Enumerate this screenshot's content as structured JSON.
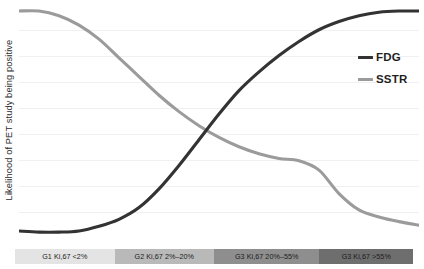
{
  "chart_data": {
    "type": "line",
    "title": "",
    "subtitle": "",
    "xlabel": "",
    "ylabel": "Likelihood of PET study being positive",
    "ylim": [
      0,
      100
    ],
    "xlim": [
      0,
      100
    ],
    "grid": true,
    "grid_orientation": "horizontal",
    "grid_lines": 8,
    "y_tick_labels": [],
    "x_tick_labels": [],
    "legend_position": "right",
    "categories": [
      "G1 Ki,67 <2%",
      "G2 Ki,67 2%–20%",
      "G3 Ki,67 20%–55%",
      "G3 Ki,67 >55%"
    ],
    "category_boundaries_pct": [
      0,
      25,
      50,
      76.5,
      100
    ],
    "category_colors": [
      "#e4e4e4",
      "#b9b9b9",
      "#8e8e8e",
      "#6e6e6e"
    ],
    "series": [
      {
        "name": "FDG",
        "color": "#333333",
        "shape": "rising sigmoid",
        "x": [
          0,
          5,
          10,
          15,
          20,
          25,
          30,
          35,
          40,
          45,
          50,
          55,
          60,
          65,
          70,
          75,
          80,
          85,
          90,
          95,
          100
        ],
        "values": [
          3,
          2.5,
          2.5,
          3,
          5,
          8,
          13,
          21,
          31,
          42,
          53,
          63,
          71,
          78,
          84,
          89,
          92.5,
          95,
          96.5,
          97,
          97
        ]
      },
      {
        "name": "SSTR",
        "color": "#9b9b9b",
        "shape": "falling double sigmoid",
        "x": [
          0,
          5,
          10,
          15,
          20,
          25,
          30,
          35,
          40,
          45,
          50,
          55,
          60,
          65,
          70,
          75,
          80,
          85,
          90,
          95,
          100
        ],
        "values": [
          97,
          97,
          95,
          91,
          85,
          77,
          69,
          61,
          54,
          48,
          43,
          39,
          36,
          34,
          33,
          29,
          19,
          12,
          9,
          7,
          5.5
        ]
      }
    ],
    "annotations": []
  },
  "legend": {
    "items": [
      {
        "label": "FDG",
        "color": "#333333"
      },
      {
        "label": "SSTR",
        "color": "#9b9b9b"
      }
    ]
  },
  "axis": {
    "y_title": "Likelihood of PET study being positive"
  }
}
